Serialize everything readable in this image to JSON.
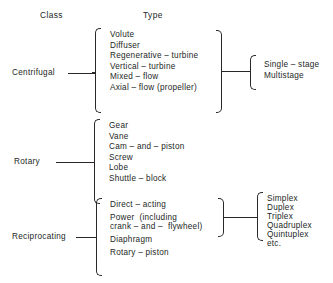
{
  "diagram": {
    "title_columns": {
      "class_header": "Class",
      "type_header": "Type"
    },
    "groups": [
      {
        "class_label": "Centrifugal",
        "types": [
          "Volute",
          "Diffuser",
          "Regenerative – turbine",
          "Vertical – turbine",
          "Mixed – flow",
          "Axial – flow (propeller)"
        ],
        "stage_labels": [
          "Single – stage",
          "Multistage"
        ]
      },
      {
        "class_label": "Rotary",
        "types": [
          "Gear",
          "Vane",
          "Cam – and – piston",
          "Screw",
          "Lobe",
          "Shuttle – block"
        ],
        "stage_labels": []
      },
      {
        "class_label": "Reciprocating",
        "types": [
          "Direct – acting",
          "Power  (including",
          "crank – and –  flywheel)",
          "Diaphragm",
          "Rotary – piston"
        ],
        "stage_labels": [
          "Simplex",
          "Duplex",
          "Triplex",
          "Quadruplex",
          "Quintuplex",
          "etc."
        ]
      }
    ],
    "colors": {
      "ink": "#231f1e",
      "line": "#2b2726",
      "background": "#ffffff"
    }
  }
}
